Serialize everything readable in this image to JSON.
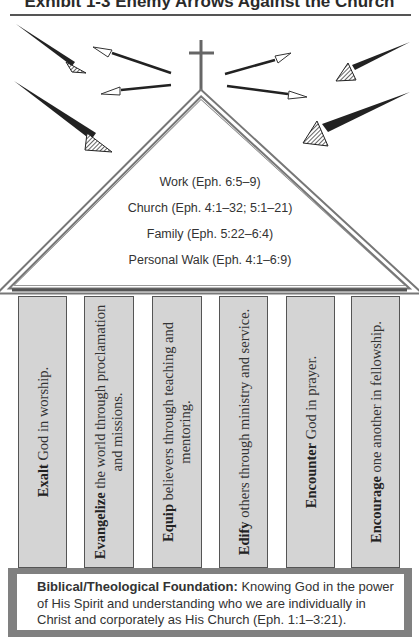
{
  "exhibit": {
    "title": "Exhibit 1-3   Enemy Arrows Against the Church"
  },
  "roof": {
    "lines": [
      "Work  (Eph. 6:5–9)",
      "Church  (Eph. 4:1–32; 5:1–21)",
      "Family  (Eph. 5:22–6:4)",
      "Personal Walk  (Eph. 4:1–6:9)"
    ]
  },
  "pillars": [
    {
      "bold": "Exalt",
      "rest": " God in worship."
    },
    {
      "bold": "Evangelize",
      "rest": " the world through proclamation and missions."
    },
    {
      "bold": "Equip",
      "rest": " believers through teaching and mentoring."
    },
    {
      "bold": "Edify",
      "rest": " others through ministry and service."
    },
    {
      "bold": "Encounter",
      "rest": " God in prayer."
    },
    {
      "bold": "Encourage",
      "rest": " one another in fellowship."
    }
  ],
  "foundation": {
    "label": "Biblical/Theological Foundation:",
    "text": " Knowing God in the power of His Spirit and understanding who we are individually in Christ and corporately as His Church (Eph. 1:1–3:21)."
  },
  "colors": {
    "pillar_fill": "#d4d4d4",
    "foundation_border": "#808080",
    "arrow_dark": "#222222"
  },
  "icons": {
    "enemy_arrows": "hatched-arrow-icon",
    "outgoing_arrows": "white-arrow-icon",
    "cross": "cross-icon"
  }
}
